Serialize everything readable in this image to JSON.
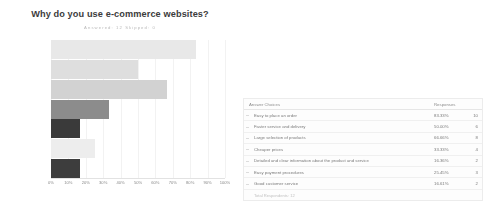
{
  "chart": {
    "title": "Why do you use e-commerce websites?",
    "subtitle": "Answered: 12    Skipped: 0"
  },
  "chart_data": {
    "type": "bar",
    "orientation": "horizontal",
    "title": "Why do you use e-commerce websites?",
    "xlabel": "",
    "ylabel": "",
    "xlim": [
      0,
      100
    ],
    "grid": true,
    "legend": "none",
    "categories": [
      "Easy to place\nan order",
      "Faster service\nand delivery",
      "Large\nselection of ...",
      "Cheaper prices",
      "Detailed and\nclear",
      "Easy payment\nprocedures",
      "Good customer\nservice"
    ],
    "values": [
      83.33,
      50.0,
      66.67,
      33.33,
      16.67,
      25.0,
      16.67
    ],
    "counts": [
      10,
      6,
      8,
      4,
      2,
      3,
      2
    ],
    "bar_colors": [
      "#e8e8e8",
      "#dedede",
      "#d2d2d2",
      "#8c8c8c",
      "#3a3a3a",
      "#ededed",
      "#3d3d3d"
    ],
    "tick_labels": [
      "0%",
      "10%",
      "20%",
      "30%",
      "40%",
      "50%",
      "60%",
      "70%",
      "80%",
      "90%",
      "100%"
    ],
    "tick_values": [
      0,
      10,
      20,
      30,
      40,
      50,
      60,
      70,
      80,
      90,
      100
    ]
  },
  "ylabels": [
    [
      "Easy to place",
      "an order"
    ],
    [
      "Faster service",
      "and delivery"
    ],
    [
      "Large",
      "selection of ..."
    ],
    [
      "Cheaper prices",
      ""
    ],
    [
      "Detailed and",
      "clear"
    ],
    [
      "Easy payment",
      "procedures"
    ],
    [
      "Good customer",
      "service"
    ]
  ],
  "table": {
    "headers": {
      "choice": "Answer Choices",
      "responses": "Responses"
    },
    "rows": [
      {
        "choice": "Easy to place an order",
        "pct": "83.33%",
        "count": "10"
      },
      {
        "choice": "Faster service and delivery",
        "pct": "50.00%",
        "count": "6"
      },
      {
        "choice": "Large selection of products",
        "pct": "66.66%",
        "count": "8"
      },
      {
        "choice": "Cheaper prices",
        "pct": "33.33%",
        "count": "4"
      },
      {
        "choice": "Detailed and clear information about the product and service",
        "pct": "16.36%",
        "count": "2"
      },
      {
        "choice": "Easy payment procedures",
        "pct": "25.45%",
        "count": "3"
      },
      {
        "choice": "Good customer service",
        "pct": "16.61%",
        "count": "2"
      }
    ],
    "footer": "Total Respondents: 12"
  }
}
